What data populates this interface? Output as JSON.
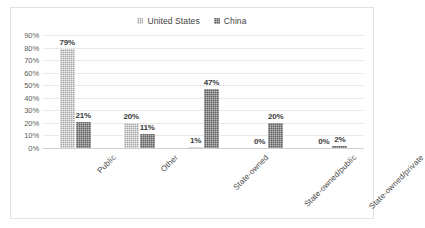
{
  "chart_data": {
    "type": "bar",
    "title": "",
    "xlabel": "",
    "ylabel": "",
    "categories": [
      "Public",
      "Other",
      "State-owned",
      "State-owned/public",
      "State-owned/private"
    ],
    "series": [
      {
        "name": "United States",
        "values": [
          79,
          20,
          1,
          0,
          0
        ],
        "color": "#a6a6a6"
      },
      {
        "name": "China",
        "values": [
          21,
          11,
          47,
          20,
          2
        ],
        "color": "#636363"
      }
    ],
    "value_labels": [
      [
        "79%",
        "20%",
        "1%",
        "0%",
        "0%"
      ],
      [
        "21%",
        "11%",
        "47%",
        "20%",
        "2%"
      ]
    ],
    "ylim": [
      0,
      90
    ],
    "y_ticks": [
      0,
      10,
      20,
      30,
      40,
      50,
      60,
      70,
      80,
      90
    ],
    "y_tick_labels": [
      "0%",
      "10%",
      "20%",
      "30%",
      "40%",
      "50%",
      "60%",
      "70%",
      "80%",
      "90%"
    ],
    "grid": true,
    "legend_position": "top-center"
  },
  "legend": {
    "entries": [
      {
        "label": "United States",
        "marker": "legend-swatch-icon"
      },
      {
        "label": "China",
        "marker": "legend-swatch-icon"
      }
    ]
  }
}
